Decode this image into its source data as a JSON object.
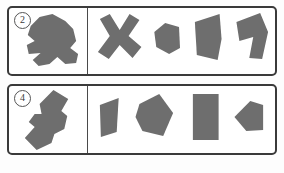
{
  "sheet": {
    "background_color": "#fdfdfd",
    "shape_fill_color": "#6e6e6e",
    "border_color": "#3a3a3a",
    "divider_color": "#4a4a4a"
  },
  "items": [
    {
      "number_label": "②",
      "number_text": "2",
      "prompt": {
        "name": "composite-figure",
        "description": "dark gray irregular composite polygon, arrow/animal-like silhouette pointing right with notched lower tail"
      },
      "options": [
        {
          "label": "A",
          "name": "x-cross-shape",
          "description": "thick diagonal X cross"
        },
        {
          "label": "B",
          "name": "small-pentagon-shape",
          "description": "small rounded pentagon tilted"
        },
        {
          "label": "C",
          "name": "large-triangle-quad-shape",
          "description": "large right-pointing triangular quadrilateral"
        },
        {
          "label": "D",
          "name": "seven-elbow-shape",
          "description": "tilted seven / elbow L shape"
        }
      ]
    },
    {
      "number_label": "④",
      "number_text": "4",
      "prompt": {
        "name": "composite-figure",
        "description": "dark gray elongated diagonal composite polygon running lower-left to upper-right with a step notch"
      },
      "options": [
        {
          "label": "A",
          "name": "slanted-quadrilateral-shape",
          "description": "narrow slanted quadrilateral leaning right"
        },
        {
          "label": "B",
          "name": "wide-pentagon-shape",
          "description": "wide irregular pentagon"
        },
        {
          "label": "C",
          "name": "upright-rectangle-shape",
          "description": "upright solid rectangle"
        },
        {
          "label": "D",
          "name": "small-house-pentagon-shape",
          "description": "small pentagon with point at left"
        }
      ]
    }
  ]
}
